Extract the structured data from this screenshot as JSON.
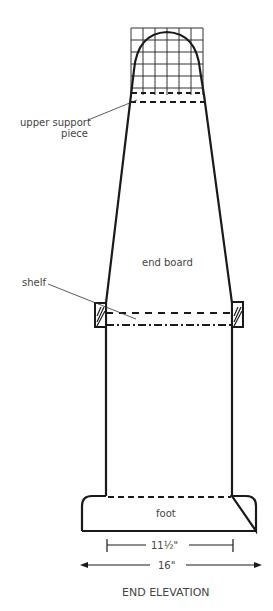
{
  "title": "END ELEVATION",
  "labels": {
    "upper_support_line1": "upper support",
    "upper_support_line2": "piece",
    "shelf": "shelf",
    "end_board": "end board",
    "foot": "foot"
  },
  "dimensions": {
    "inner_width": "11½\"",
    "outer_width": "16\""
  },
  "colors": {
    "line": "#1a1a1a",
    "grid": "#333333",
    "text": "#444444"
  }
}
